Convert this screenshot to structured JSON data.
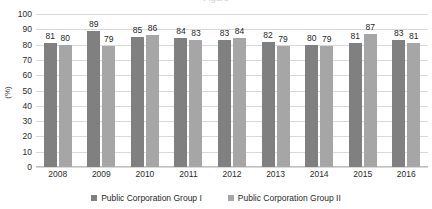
{
  "chart_data": {
    "type": "bar",
    "title": "",
    "xlabel": "",
    "ylabel": "(%)",
    "ylim": [
      0,
      100
    ],
    "ytick_step": 10,
    "yticks": [
      100,
      90,
      80,
      70,
      60,
      50,
      40,
      30,
      20,
      10,
      0
    ],
    "grid": true,
    "legend_position": "bottom-center",
    "categories": [
      "2008",
      "2009",
      "2010",
      "2011",
      "2012",
      "2013",
      "2014",
      "2015",
      "2016"
    ],
    "series": [
      {
        "name": "Public Corporation Group I",
        "color": "#808080",
        "values": [
          81,
          89,
          85,
          84,
          83,
          82,
          80,
          81,
          83
        ]
      },
      {
        "name": "Public Corporation Group II",
        "color": "#a6a6a6",
        "values": [
          80,
          79,
          86,
          83,
          84,
          79,
          79,
          87,
          81
        ]
      }
    ]
  },
  "title_sliver": {
    "text": "Figure"
  },
  "colors": {
    "series1": "#808080",
    "series2": "#a6a6a6",
    "gridline": "#d9d9d9",
    "axis": "#bfbfbf",
    "text": "#1f1f1f"
  }
}
